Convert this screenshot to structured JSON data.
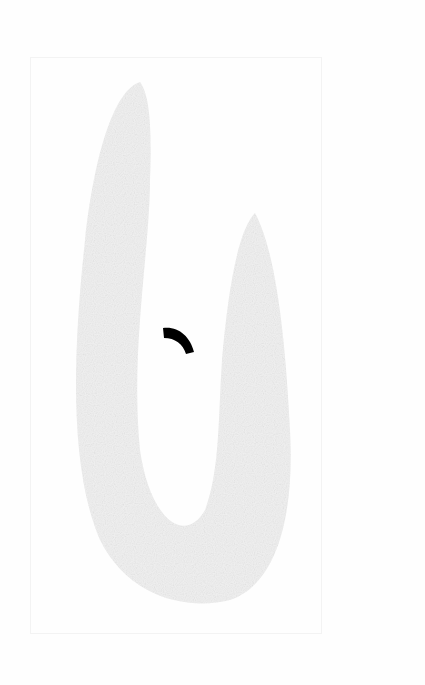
{
  "page": {
    "background": "#fefefe",
    "frame_color": "#f3f3f3",
    "shape_color": "#ececec",
    "mark_color": "#000000"
  },
  "illustration": {
    "subject": "faded U-shaped leaf-like outline",
    "mark": "black curved arc"
  }
}
